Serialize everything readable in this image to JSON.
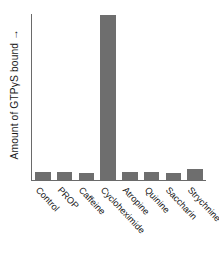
{
  "chart_data": {
    "type": "bar",
    "title": "",
    "subtitle": "",
    "xlabel": "",
    "ylabel": "Amount of GTPγS bound",
    "ylabel_arrow": "→",
    "categories": [
      "Control",
      "PROP",
      "Caffeine",
      "Cycloheximide",
      "Atropine",
      "Quinine",
      "Saccharin",
      "Strychnine"
    ],
    "values": [
      4.5,
      4.8,
      4.2,
      100,
      5.0,
      4.6,
      4.0,
      6.5
    ],
    "ylim": [
      0,
      100
    ],
    "y_ticks": [],
    "y_tick_labels": [],
    "x_ticks_rotation": 47,
    "grid": false,
    "legend": false,
    "legend_position": "none",
    "bar_color": "#6e6e6e",
    "axis_color": "#6a6a6a",
    "background_color": "#ffffff",
    "annotations": []
  }
}
